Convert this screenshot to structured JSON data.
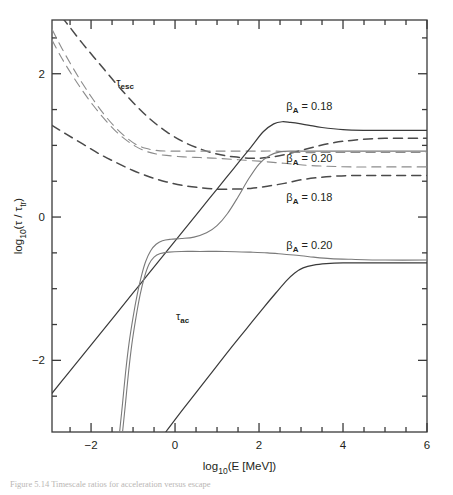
{
  "figure": {
    "caption_partial": "Figure 5.14 Timescale ratios for acceleration versus escape"
  },
  "chart_data": {
    "type": "line",
    "title": "",
    "xlabel": "log10(E [MeV])",
    "ylabel": "log10(tau / tau_tr)",
    "xlim": [
      -2.93,
      6.0
    ],
    "ylim": [
      -3.0,
      2.75
    ],
    "grid": false,
    "legend_position": "inline-annotations",
    "x_ticks_major": [
      -2,
      0,
      2,
      4,
      6
    ],
    "x_ticks_major_labels": [
      "−2",
      "0",
      "2",
      "4",
      "6"
    ],
    "x_ticks_minor": [
      -2.5,
      -1.5,
      -1.0,
      -0.5,
      0.5,
      1.0,
      1.5,
      2.5,
      3.0,
      3.5,
      4.5,
      5.0,
      5.5
    ],
    "y_ticks_major": [
      -2,
      0,
      2
    ],
    "y_ticks_major_labels": [
      "−2",
      "0",
      "2"
    ],
    "y_ticks_minor": [
      -2.5,
      -1.5,
      -1.0,
      -0.5,
      0.5,
      1.0,
      1.5,
      2.5
    ],
    "annotations": [
      {
        "name": "tau-esc-label",
        "text": "τ",
        "sub": "esc",
        "x": -1.4,
        "y": 1.83
      },
      {
        "name": "tau-ac-label",
        "text": "τ",
        "sub": "ac",
        "x": 0.02,
        "y": -1.43
      },
      {
        "name": "beta-label-top",
        "text": "β",
        "sub": "A",
        "rest": " = 0.18",
        "x": 2.65,
        "y": 1.5
      },
      {
        "name": "beta-label-second",
        "text": "β",
        "sub": "A",
        "rest": " = 0.20",
        "x": 2.65,
        "y": 0.77
      },
      {
        "name": "beta-label-third",
        "text": "β",
        "sub": "A",
        "rest": " = 0.18",
        "x": 2.65,
        "y": 0.22
      },
      {
        "name": "beta-label-bottom",
        "text": "β",
        "sub": "A",
        "rest": " = 0.20",
        "x": 2.65,
        "y": -0.44
      }
    ],
    "series": [
      {
        "name": "tau_esc_outer_dashed",
        "style": "dashed",
        "color": "#4a4a4a",
        "width": 1.5,
        "points": [
          [
            -2.93,
            2.95
          ],
          [
            -2.6,
            2.72
          ],
          [
            -2.2,
            2.42
          ],
          [
            -1.8,
            2.14
          ],
          [
            -1.4,
            1.86
          ],
          [
            -1.0,
            1.6
          ],
          [
            -0.6,
            1.37
          ],
          [
            -0.2,
            1.19
          ],
          [
            0.2,
            1.05
          ],
          [
            0.6,
            0.95
          ],
          [
            1.0,
            0.88
          ],
          [
            1.4,
            0.84
          ],
          [
            1.8,
            0.82
          ],
          [
            2.2,
            0.83
          ],
          [
            2.6,
            0.87
          ],
          [
            3.0,
            0.93
          ],
          [
            3.4,
            0.99
          ],
          [
            3.8,
            1.04
          ],
          [
            4.2,
            1.07
          ],
          [
            4.6,
            1.09
          ],
          [
            5.0,
            1.1
          ],
          [
            5.5,
            1.1
          ],
          [
            6.0,
            1.1
          ]
        ]
      },
      {
        "name": "tau_esc_mid_dashed_a",
        "style": "dashed",
        "color": "#8c8c8c",
        "width": 1.1,
        "points": [
          [
            -2.93,
            2.62
          ],
          [
            -2.7,
            2.36
          ],
          [
            -2.45,
            2.1
          ],
          [
            -2.2,
            1.86
          ],
          [
            -1.95,
            1.64
          ],
          [
            -1.7,
            1.44
          ],
          [
            -1.45,
            1.27
          ],
          [
            -1.2,
            1.13
          ],
          [
            -0.95,
            1.02
          ],
          [
            -0.7,
            0.96
          ],
          [
            -0.45,
            0.93
          ],
          [
            -0.2,
            0.92
          ],
          [
            0.1,
            0.92
          ],
          [
            0.5,
            0.92
          ],
          [
            1.0,
            0.92
          ],
          [
            1.5,
            0.92
          ],
          [
            2.0,
            0.92
          ],
          [
            2.4,
            0.92
          ],
          [
            2.7,
            0.91
          ],
          [
            3.0,
            0.9
          ],
          [
            3.5,
            0.9
          ],
          [
            4.0,
            0.9
          ],
          [
            5.0,
            0.9
          ],
          [
            6.0,
            0.9
          ]
        ]
      },
      {
        "name": "tau_esc_mid_dashed_b",
        "style": "dashed",
        "color": "#8c8c8c",
        "width": 1.1,
        "points": [
          [
            -2.93,
            2.47
          ],
          [
            -2.7,
            2.22
          ],
          [
            -2.45,
            1.98
          ],
          [
            -2.2,
            1.76
          ],
          [
            -1.95,
            1.56
          ],
          [
            -1.7,
            1.38
          ],
          [
            -1.45,
            1.22
          ],
          [
            -1.2,
            1.09
          ],
          [
            -0.95,
            0.99
          ],
          [
            -0.7,
            0.92
          ],
          [
            -0.45,
            0.88
          ],
          [
            -0.2,
            0.86
          ],
          [
            0.2,
            0.84
          ],
          [
            0.6,
            0.83
          ],
          [
            1.0,
            0.82
          ],
          [
            1.5,
            0.8
          ],
          [
            2.0,
            0.78
          ],
          [
            2.4,
            0.76
          ],
          [
            2.8,
            0.74
          ],
          [
            3.2,
            0.72
          ],
          [
            3.6,
            0.71
          ],
          [
            4.2,
            0.7
          ],
          [
            5.0,
            0.7
          ],
          [
            6.0,
            0.7
          ]
        ]
      },
      {
        "name": "tau_esc_lower_dashed",
        "style": "dashed",
        "color": "#4a4a4a",
        "width": 1.5,
        "points": [
          [
            -2.93,
            1.28
          ],
          [
            -2.6,
            1.16
          ],
          [
            -2.2,
            1.02
          ],
          [
            -1.8,
            0.88
          ],
          [
            -1.4,
            0.76
          ],
          [
            -1.0,
            0.65
          ],
          [
            -0.6,
            0.56
          ],
          [
            -0.2,
            0.49
          ],
          [
            0.2,
            0.44
          ],
          [
            0.6,
            0.41
          ],
          [
            1.0,
            0.39
          ],
          [
            1.4,
            0.39
          ],
          [
            1.8,
            0.4
          ],
          [
            2.2,
            0.43
          ],
          [
            2.6,
            0.47
          ],
          [
            3.0,
            0.52
          ],
          [
            3.4,
            0.55
          ],
          [
            3.8,
            0.57
          ],
          [
            4.2,
            0.58
          ],
          [
            4.8,
            0.58
          ],
          [
            5.4,
            0.58
          ],
          [
            6.0,
            0.58
          ]
        ]
      },
      {
        "name": "tau_ac_steep_left_solid",
        "style": "solid",
        "color": "#3a3a3a",
        "width": 1.2,
        "points": [
          [
            -2.93,
            -2.46
          ],
          [
            -2.6,
            -2.22
          ],
          [
            -2.2,
            -1.93
          ],
          [
            -1.8,
            -1.64
          ],
          [
            -1.4,
            -1.35
          ],
          [
            -1.0,
            -1.06
          ],
          [
            -0.6,
            -0.77
          ],
          [
            -0.2,
            -0.48
          ],
          [
            0.2,
            -0.19
          ],
          [
            0.6,
            0.1
          ],
          [
            1.0,
            0.39
          ],
          [
            1.4,
            0.68
          ],
          [
            1.8,
            0.97
          ],
          [
            2.1,
            1.19
          ],
          [
            2.35,
            1.3
          ],
          [
            2.55,
            1.33
          ],
          [
            2.75,
            1.32
          ],
          [
            3.0,
            1.3
          ],
          [
            3.2,
            1.28
          ],
          [
            3.5,
            1.25
          ],
          [
            4.0,
            1.22
          ],
          [
            4.5,
            1.21
          ],
          [
            5.0,
            1.21
          ],
          [
            5.5,
            1.21
          ],
          [
            6.0,
            1.21
          ]
        ]
      },
      {
        "name": "tau_ac_vertical_solid_upper",
        "style": "solid",
        "color": "#7a7a7a",
        "width": 1.1,
        "points": [
          [
            -1.32,
            -3.0
          ],
          [
            -1.25,
            -2.6
          ],
          [
            -1.18,
            -2.18
          ],
          [
            -1.1,
            -1.78
          ],
          [
            -1.0,
            -1.4
          ],
          [
            -0.9,
            -1.08
          ],
          [
            -0.8,
            -0.82
          ],
          [
            -0.7,
            -0.62
          ],
          [
            -0.58,
            -0.47
          ],
          [
            -0.45,
            -0.38
          ],
          [
            -0.3,
            -0.33
          ],
          [
            -0.1,
            -0.31
          ],
          [
            0.15,
            -0.3
          ],
          [
            0.45,
            -0.28
          ],
          [
            0.75,
            -0.22
          ],
          [
            1.0,
            -0.12
          ],
          [
            1.25,
            0.05
          ],
          [
            1.5,
            0.28
          ],
          [
            1.75,
            0.53
          ],
          [
            2.0,
            0.74
          ],
          [
            2.25,
            0.86
          ],
          [
            2.5,
            0.91
          ],
          [
            2.8,
            0.92
          ],
          [
            3.2,
            0.92
          ],
          [
            4.0,
            0.92
          ],
          [
            5.0,
            0.92
          ],
          [
            6.0,
            0.92
          ]
        ]
      },
      {
        "name": "tau_ac_vertical_solid_lower",
        "style": "solid",
        "color": "#7a7a7a",
        "width": 1.1,
        "points": [
          [
            -1.25,
            -3.0
          ],
          [
            -1.18,
            -2.6
          ],
          [
            -1.11,
            -2.18
          ],
          [
            -1.03,
            -1.78
          ],
          [
            -0.93,
            -1.4
          ],
          [
            -0.83,
            -1.08
          ],
          [
            -0.73,
            -0.84
          ],
          [
            -0.62,
            -0.66
          ],
          [
            -0.5,
            -0.56
          ],
          [
            -0.35,
            -0.51
          ],
          [
            -0.15,
            -0.49
          ],
          [
            0.15,
            -0.48
          ],
          [
            0.6,
            -0.48
          ],
          [
            1.2,
            -0.48
          ],
          [
            1.8,
            -0.49
          ],
          [
            2.2,
            -0.5
          ],
          [
            2.6,
            -0.52
          ],
          [
            3.0,
            -0.54
          ],
          [
            3.3,
            -0.56
          ],
          [
            3.7,
            -0.58
          ],
          [
            4.2,
            -0.59
          ],
          [
            5.0,
            -0.6
          ],
          [
            6.0,
            -0.6
          ]
        ]
      },
      {
        "name": "tau_ac_right_solid",
        "style": "solid",
        "color": "#3a3a3a",
        "width": 1.2,
        "points": [
          [
            -0.22,
            -3.0
          ],
          [
            0.1,
            -2.75
          ],
          [
            0.5,
            -2.45
          ],
          [
            0.9,
            -2.15
          ],
          [
            1.3,
            -1.85
          ],
          [
            1.7,
            -1.56
          ],
          [
            2.1,
            -1.27
          ],
          [
            2.4,
            -1.06
          ],
          [
            2.65,
            -0.89
          ],
          [
            2.85,
            -0.78
          ],
          [
            3.05,
            -0.71
          ],
          [
            3.3,
            -0.67
          ],
          [
            3.6,
            -0.65
          ],
          [
            4.0,
            -0.64
          ],
          [
            4.6,
            -0.64
          ],
          [
            5.2,
            -0.64
          ],
          [
            6.0,
            -0.64
          ]
        ]
      }
    ]
  }
}
